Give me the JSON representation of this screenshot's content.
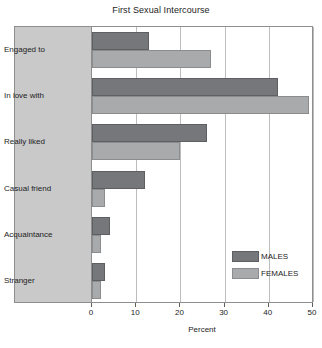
{
  "chart_data": {
    "type": "bar",
    "orientation": "horizontal",
    "title": "First Sexual Intercourse",
    "xlabel": "Percent",
    "ylabel": "",
    "xlim": [
      0,
      50
    ],
    "xticks": [
      0,
      10,
      20,
      30,
      40,
      50
    ],
    "grid": true,
    "legend_position": "inside-right",
    "categories": [
      "Engaged to",
      "In love with",
      "Really liked",
      "Casual friend",
      "Acquaintance",
      "Stranger"
    ],
    "series": [
      {
        "name": "MALES",
        "color": "#76777a",
        "values": [
          13,
          42,
          26,
          12,
          4,
          3
        ]
      },
      {
        "name": "FEMALES",
        "color": "#a9aaac",
        "values": [
          27,
          49,
          20,
          3,
          2,
          2
        ]
      }
    ]
  },
  "panel": {
    "background_color": "#c9c9c9"
  }
}
